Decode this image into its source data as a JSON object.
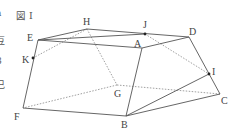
{
  "figure": {
    "title": "図 I",
    "vertices": [
      {
        "name": "A",
        "x": 142,
        "y": 48
      },
      {
        "name": "B",
        "x": 126,
        "y": 116
      },
      {
        "name": "C",
        "x": 220,
        "y": 94
      },
      {
        "name": "D",
        "x": 189,
        "y": 37
      },
      {
        "name": "E",
        "x": 38,
        "y": 40
      },
      {
        "name": "F",
        "x": 23,
        "y": 108
      },
      {
        "name": "G",
        "x": 117,
        "y": 85
      },
      {
        "name": "H",
        "x": 87,
        "y": 29
      }
    ],
    "points": [
      {
        "name": "I",
        "x": 209,
        "y": 74
      },
      {
        "name": "J",
        "x": 145,
        "y": 34
      },
      {
        "name": "K",
        "x": 33,
        "y": 58
      }
    ],
    "solid_edges": [
      [
        "E",
        "A"
      ],
      [
        "A",
        "D"
      ],
      [
        "E",
        "H"
      ],
      [
        "H",
        "D"
      ],
      [
        "E",
        "J"
      ],
      [
        "A",
        "B"
      ],
      [
        "E",
        "F"
      ],
      [
        "F",
        "B"
      ],
      [
        "B",
        "C"
      ],
      [
        "D",
        "C"
      ],
      [
        "B",
        "I"
      ]
    ],
    "dashed_edges": [
      [
        "H",
        "G"
      ],
      [
        "G",
        "F"
      ],
      [
        "G",
        "C"
      ],
      [
        "H",
        "K"
      ],
      [
        "J",
        "I"
      ]
    ],
    "labels": [
      {
        "text": "図 I",
        "x": 16,
        "y": 19,
        "cls": "title"
      },
      {
        "text": "H",
        "x": 83,
        "y": 25
      },
      {
        "text": "J",
        "x": 143,
        "y": 28
      },
      {
        "text": "D",
        "x": 189,
        "y": 35
      },
      {
        "text": "E",
        "x": 27,
        "y": 41
      },
      {
        "text": "A",
        "x": 134,
        "y": 47
      },
      {
        "text": "K",
        "x": 22,
        "y": 63
      },
      {
        "text": "I",
        "x": 212,
        "y": 75
      },
      {
        "text": "G",
        "x": 114,
        "y": 97
      },
      {
        "text": "C",
        "x": 221,
        "y": 104
      },
      {
        "text": "F",
        "x": 14,
        "y": 120
      },
      {
        "text": "B",
        "x": 121,
        "y": 128
      }
    ]
  },
  "edge_fragments": [
    "a",
    "豆",
    "8",
    "己"
  ]
}
